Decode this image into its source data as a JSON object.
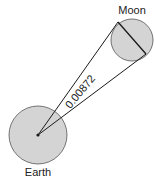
{
  "diagram": {
    "labels": {
      "moon": "Moon",
      "earth": "Earth",
      "angle": "0.00872"
    },
    "colors": {
      "body_fill": "#d4d4d4",
      "stroke": "#1a1a1a"
    }
  }
}
